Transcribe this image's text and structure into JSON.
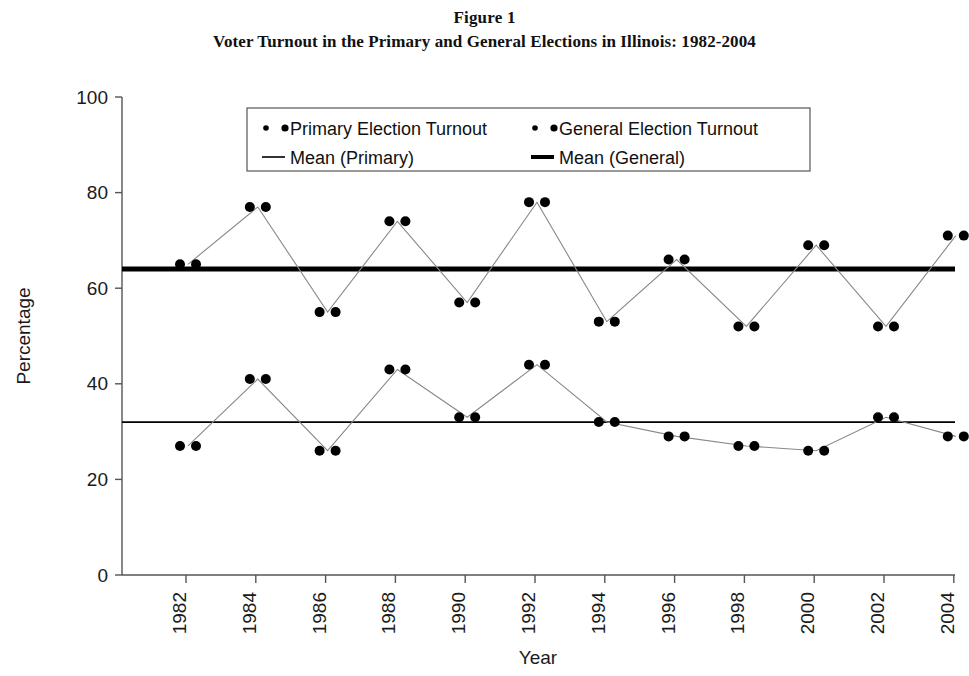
{
  "figure": {
    "label": "Figure 1",
    "title": "Voter Turnout in the Primary and General Elections in Illinois: 1982-2004"
  },
  "axes": {
    "y_title": "Percentage",
    "x_title": "Year",
    "y_ticks": [
      "0",
      "20",
      "40",
      "60",
      "80",
      "100"
    ],
    "x_ticks": [
      "1982",
      "1984",
      "1986",
      "1988",
      "1990",
      "1992",
      "1994",
      "1996",
      "1998",
      "2000",
      "2002",
      "2004"
    ]
  },
  "legend": {
    "items": [
      {
        "label": "Primary Election Turnout",
        "marker": "paired-dots",
        "color": "#000000"
      },
      {
        "label": "General Election Turnout",
        "marker": "paired-dots",
        "color": "#000000"
      },
      {
        "label": "Mean (Primary)",
        "marker": "thin-line",
        "color": "#000000"
      },
      {
        "label": "Mean (General)",
        "marker": "thick-line",
        "color": "#000000"
      }
    ]
  },
  "chart_data": {
    "type": "line",
    "title": "Voter Turnout in the Primary and General Elections in Illinois: 1982-2004",
    "xlabel": "Year",
    "ylabel": "Percentage",
    "xlim": [
      1981,
      2005
    ],
    "ylim": [
      0,
      100
    ],
    "grid": false,
    "legend_position": "top-center",
    "x": [
      1982,
      1984,
      1986,
      1988,
      1990,
      1992,
      1994,
      1996,
      1998,
      2000,
      2002,
      2004
    ],
    "series": [
      {
        "name": "General Election Turnout",
        "values": [
          65,
          77,
          55,
          74,
          57,
          78,
          53,
          66,
          52,
          69,
          52,
          71
        ]
      },
      {
        "name": "Primary Election Turnout",
        "values": [
          27,
          41,
          26,
          43,
          33,
          44,
          32,
          29,
          27,
          26,
          33,
          29
        ]
      }
    ],
    "reference_lines": [
      {
        "name": "Mean (General)",
        "value": 64,
        "style": "thick"
      },
      {
        "name": "Mean (Primary)",
        "value": 32,
        "style": "thin"
      }
    ]
  }
}
